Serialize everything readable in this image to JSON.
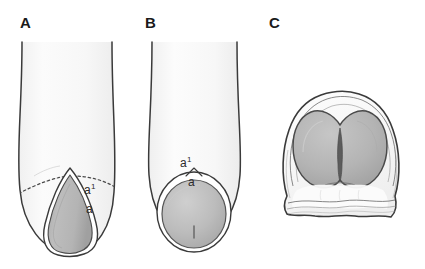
{
  "figure": {
    "background_color": "#ffffff",
    "panels": [
      {
        "id": "panel-a",
        "letter": "A",
        "view": "longitudinal-section-pointed",
        "labels": [
          {
            "id": "a1",
            "text": "a",
            "superscript": "1"
          },
          {
            "id": "a",
            "text": "a",
            "superscript": ""
          }
        ],
        "colors": {
          "outer_fill": "#f8f8f8",
          "inner_fill": "#b5b5b5",
          "outline": "#3a3a3a",
          "dashed_line": "#4a4a4a"
        }
      },
      {
        "id": "panel-b",
        "letter": "B",
        "view": "longitudinal-section-rounded",
        "labels": [
          {
            "id": "a1",
            "text": "a",
            "superscript": "1"
          },
          {
            "id": "a",
            "text": "a",
            "superscript": ""
          }
        ],
        "colors": {
          "outer_fill": "#f8f8f8",
          "inner_fill": "#bdbdbd",
          "outline": "#3a3a3a",
          "dashed_line": "#4a4a4a"
        }
      },
      {
        "id": "panel-c",
        "letter": "C",
        "view": "cross-section-bilobed",
        "labels": [],
        "colors": {
          "outer_fill": "#fbfbfb",
          "inner_fill": "#b2b2b2",
          "outline": "#3a3a3a",
          "cleft": "#555555"
        }
      }
    ]
  }
}
